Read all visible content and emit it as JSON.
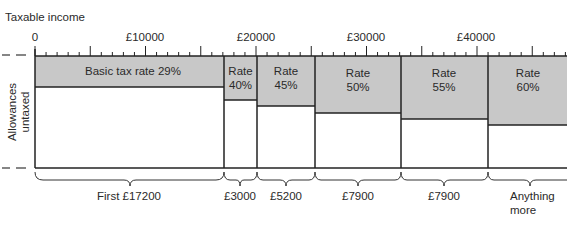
{
  "axis": {
    "title": "Taxable income",
    "ticks": [
      {
        "label": "0",
        "value": 0
      },
      {
        "label": "£10000",
        "value": 10000
      },
      {
        "label": "£20000",
        "value": 20000
      },
      {
        "label": "£30000",
        "value": 30000
      },
      {
        "label": "£40000",
        "value": 40000
      }
    ]
  },
  "side_label": {
    "line1": "Allowances",
    "line2": "untaxed"
  },
  "bands": [
    {
      "rate_label": "Basic tax rate 29%",
      "rate": 29,
      "from": 0,
      "to": 17200,
      "width_label": "First £17200"
    },
    {
      "rate_label_1": "Rate",
      "rate_label_2": "40%",
      "rate": 40,
      "from": 17200,
      "to": 20200,
      "width_label": "£3000"
    },
    {
      "rate_label_1": "Rate",
      "rate_label_2": "45%",
      "rate": 45,
      "from": 20200,
      "to": 25400,
      "width_label": "£5200"
    },
    {
      "rate_label_1": "Rate",
      "rate_label_2": "50%",
      "rate": 50,
      "from": 25400,
      "to": 33300,
      "width_label": "£7900"
    },
    {
      "rate_label_1": "Rate",
      "rate_label_2": "55%",
      "rate": 55,
      "from": 33300,
      "to": 41200,
      "width_label": "£7900"
    },
    {
      "rate_label_1": "Rate",
      "rate_label_2": "60%",
      "rate": 60,
      "from": 41200,
      "to": null,
      "width_label_1": "Anything",
      "width_label_2": "more"
    }
  ],
  "colors": {
    "band_fill": "#c8c8c8",
    "line": "#222222",
    "background": "#ffffff"
  }
}
